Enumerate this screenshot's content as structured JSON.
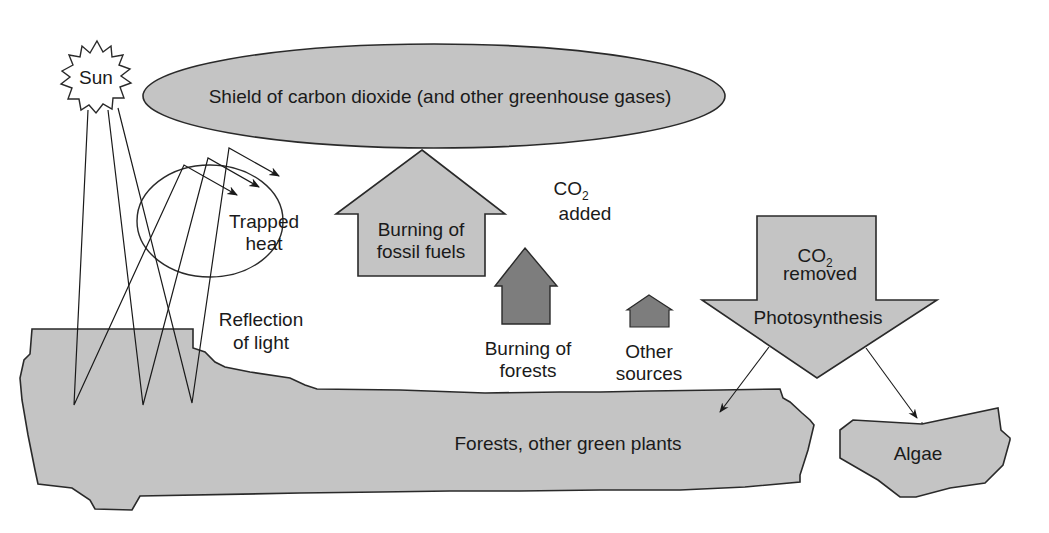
{
  "diagram": {
    "colors": {
      "light_fill": "#c4c4c4",
      "dark_fill": "#7d7d7d",
      "stroke": "#2a2a2a",
      "background": "#ffffff"
    },
    "sun": {
      "label": "Sun"
    },
    "shield": {
      "label": "Shield of carbon dioxide (and other greenhouse gases)"
    },
    "trapped_heat": {
      "line1": "Trapped",
      "line2": "heat"
    },
    "reflection": {
      "line1": "Reflection",
      "line2": "of light"
    },
    "co2_added": {
      "co": "CO",
      "sub": "2",
      "word": "added"
    },
    "fossil_fuels": {
      "line1": "Burning of",
      "line2": "fossil fuels"
    },
    "forests_burning": {
      "line1": "Burning of",
      "line2": "forests"
    },
    "other_sources": {
      "line1": "Other",
      "line2": "sources"
    },
    "co2_removed": {
      "co": "CO",
      "sub": "2",
      "word": "removed",
      "process": "Photosynthesis"
    },
    "land": {
      "label": "Forests, other green plants"
    },
    "algae": {
      "label": "Algae"
    }
  }
}
